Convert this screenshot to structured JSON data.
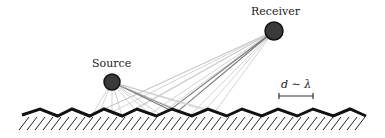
{
  "diagram": {
    "source": {
      "label": "Source",
      "x": 112,
      "y": 82,
      "r": 8
    },
    "receiver": {
      "label": "Receiver",
      "x": 274,
      "y": 31,
      "r": 9
    },
    "scale_annotation": {
      "label": "d ∼ λ",
      "x1": 279,
      "x2": 313,
      "y": 96
    },
    "surface": {
      "x_start": 22,
      "x_end": 366,
      "peaks_x": [
        40,
        72,
        104,
        137,
        172,
        208,
        242,
        278,
        313,
        350
      ],
      "peak_y": 109,
      "valley_y": 116
    },
    "colors": {
      "node_fill": "#3a3a3a",
      "node_stroke": "#111111",
      "surface": "#111111",
      "ray_light": "#c8c8c8",
      "ray_dark": "#777777"
    }
  }
}
